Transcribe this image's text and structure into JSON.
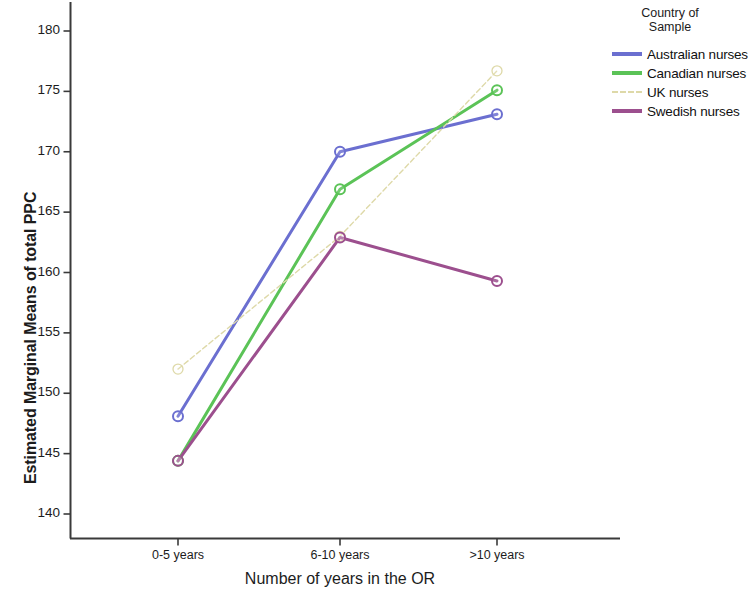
{
  "chart_data": {
    "type": "line",
    "title": "",
    "xlabel": "Number of years in the OR",
    "ylabel": "Estimated Marginal Means of total PPC",
    "categories": [
      "0-5 years",
      "6-10 years",
      ">10 years"
    ],
    "ylim": [
      138,
      181.5
    ],
    "yticks": [
      140,
      145,
      150,
      155,
      160,
      165,
      170,
      175,
      180
    ],
    "ytick_labels": [
      "140",
      "145",
      "150",
      "155",
      "160",
      "165",
      "170",
      "175",
      "180"
    ],
    "grid": false,
    "legend_position": "right",
    "legend_title": "Country of\nSample",
    "marker": "open-circle",
    "series": [
      {
        "name": "Australian nurses",
        "color": "#6b6fd0",
        "style": "solid",
        "width": 3,
        "values": [
          148.1,
          170.0,
          173.1
        ]
      },
      {
        "name": "Canadian nurses",
        "color": "#5bc357",
        "style": "solid",
        "width": 3,
        "values": [
          144.4,
          166.9,
          175.1
        ]
      },
      {
        "name": "UK nurses",
        "color": "#ded9a8",
        "style": "dashed",
        "width": 1.4,
        "values": [
          152.0,
          163.0,
          176.7
        ]
      },
      {
        "name": "Swedish nurses",
        "color": "#9c4f8e",
        "style": "solid",
        "width": 3,
        "values": [
          144.4,
          162.9,
          159.3
        ]
      }
    ]
  },
  "legend": {
    "title_line1": "Country of",
    "title_line2": "Sample",
    "entries": [
      {
        "label": "Australian nurses"
      },
      {
        "label": "Canadian nurses"
      },
      {
        "label": "UK nurses"
      },
      {
        "label": "Swedish nurses"
      }
    ]
  },
  "axes": {
    "y_title": "Estimated Marginal Means of total PPC",
    "x_title": "Number of years in the OR"
  }
}
